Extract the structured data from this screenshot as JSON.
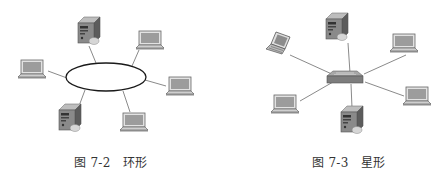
{
  "figures": [
    {
      "id": "ring",
      "caption": "图 7-2　环形",
      "topology": "ring",
      "nodes": [
        {
          "type": "server",
          "position": "top"
        },
        {
          "type": "server",
          "position": "bottom-left"
        },
        {
          "type": "laptop",
          "position": "left"
        },
        {
          "type": "laptop",
          "position": "upper-right"
        },
        {
          "type": "laptop",
          "position": "right"
        },
        {
          "type": "laptop",
          "position": "bottom-right"
        }
      ]
    },
    {
      "id": "star",
      "caption": "图 7-3　星形",
      "topology": "star",
      "hub": "switch",
      "nodes": [
        {
          "type": "server",
          "position": "top"
        },
        {
          "type": "server",
          "position": "bottom"
        },
        {
          "type": "laptop",
          "position": "upper-left",
          "style": "tilted"
        },
        {
          "type": "laptop",
          "position": "upper-right"
        },
        {
          "type": "laptop",
          "position": "right"
        },
        {
          "type": "laptop",
          "position": "bottom-left"
        }
      ]
    }
  ],
  "colors": {
    "link": "#8a8a8a",
    "ring": "#222222",
    "device_dark": "#6d6d6d",
    "device_light": "#cfcfcf",
    "screen": "#9a9a9a"
  }
}
